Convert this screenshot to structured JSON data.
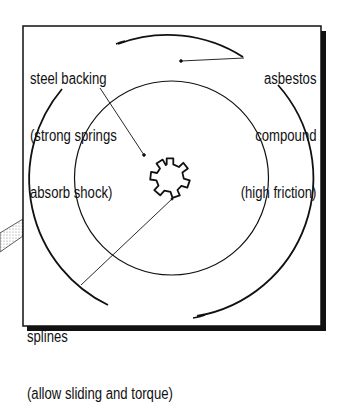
{
  "diagram": {
    "colors": {
      "ink": "#111111",
      "background": "#ffffff",
      "stipple": "#bbbbbb"
    },
    "labels": {
      "steel_backing": {
        "lines": [
          "steel backing",
          "(strong springs",
          "absorb shock)"
        ]
      },
      "asbestos": {
        "lines": [
          "asbestos",
          "compound",
          "(high friction)"
        ]
      },
      "splines": {
        "lines": [
          "splines",
          "(allow sliding and torque)"
        ]
      }
    },
    "parts": [
      "frame",
      "outer-circle",
      "inner-circle",
      "spline-gear",
      "shaft-stub"
    ]
  }
}
